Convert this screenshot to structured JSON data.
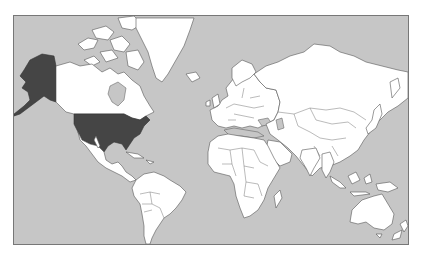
{
  "map": {
    "type": "world-map",
    "projection": "mercator",
    "colors": {
      "ocean": "#c6c6c6",
      "land": "#ffffff",
      "highlight": "#454545",
      "water_inland": "#c6c6c6",
      "frame": "#777777"
    },
    "highlighted_regions": [
      {
        "name": "United States (contiguous)",
        "color": "#454545"
      },
      {
        "name": "Alaska",
        "color": "#454545"
      }
    ],
    "regions": [
      "North America",
      "Greenland",
      "Central America",
      "South America",
      "Europe",
      "Africa",
      "Asia",
      "Australia",
      "New Zealand",
      "Indonesia",
      "Japan"
    ]
  }
}
